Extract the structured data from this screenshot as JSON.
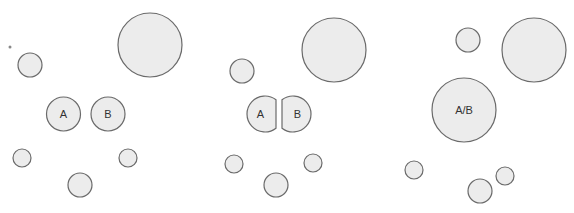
{
  "diagram": {
    "colors": {
      "fill": "#ececec",
      "stroke": "#6a6a6a",
      "text": "#333333",
      "background": "#ffffff"
    },
    "panels": [
      {
        "id": "panel-1",
        "stray_dot": {
          "cx": 10,
          "cy": 47,
          "r": 1.5
        },
        "circles": [
          {
            "cx": 150,
            "cy": 45,
            "r": 32
          },
          {
            "cx": 30,
            "cy": 65,
            "r": 12
          },
          {
            "cx": 22,
            "cy": 158,
            "r": 9
          },
          {
            "cx": 128,
            "cy": 158,
            "r": 9
          },
          {
            "cx": 80,
            "cy": 185,
            "r": 12
          }
        ],
        "labeled_nodes": [
          {
            "label": "A",
            "cx": 63.5,
            "cy": 114,
            "r": 17
          },
          {
            "label": "B",
            "cx": 108,
            "cy": 114,
            "r": 17
          }
        ]
      },
      {
        "id": "panel-2",
        "circles": [
          {
            "cx": 334,
            "cy": 50,
            "r": 32
          },
          {
            "cx": 242,
            "cy": 71,
            "r": 12
          },
          {
            "cx": 234,
            "cy": 164,
            "r": 9
          },
          {
            "cx": 313,
            "cy": 163,
            "r": 9
          },
          {
            "cx": 276,
            "cy": 185,
            "r": 12
          }
        ],
        "labeled_nodes": [
          {
            "label": "A",
            "shape": "half-circle-cut-right",
            "x_left": 247,
            "x_cut": 276,
            "cy": 114,
            "r": 18
          },
          {
            "label": "B",
            "shape": "half-circle-cut-left",
            "x_cut": 282,
            "x_right": 311,
            "cy": 114,
            "r": 18
          }
        ]
      },
      {
        "id": "panel-3",
        "circles": [
          {
            "cx": 534,
            "cy": 50,
            "r": 32
          },
          {
            "cx": 468,
            "cy": 40,
            "r": 12
          },
          {
            "cx": 414,
            "cy": 170,
            "r": 9
          },
          {
            "cx": 505,
            "cy": 176,
            "r": 9
          },
          {
            "cx": 480,
            "cy": 191,
            "r": 12
          }
        ],
        "labeled_nodes": [
          {
            "label": "A/B",
            "cx": 464,
            "cy": 110,
            "r": 32
          }
        ]
      }
    ]
  }
}
